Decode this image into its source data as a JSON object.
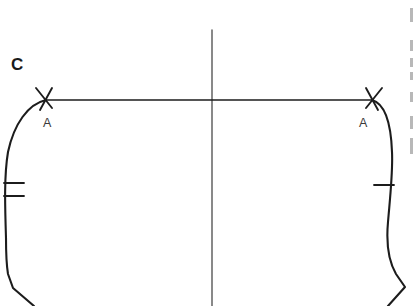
{
  "document": {
    "type": "scanned-pattern-diagram",
    "background_color": "#ffffff",
    "ink_color": "#1c1c1c",
    "width": 416,
    "height": 306
  },
  "labels": {
    "piece": "C",
    "notch_left": "A",
    "notch_right": "A"
  },
  "annotations": {
    "piece_label_note": "Pattern piece identifier",
    "notch_note": "Matching point marks"
  },
  "geometry": {
    "horizontal_rule": {
      "x1": 46,
      "y1": 100,
      "x2": 372,
      "y2": 100
    },
    "center_fold_line": {
      "x": 212,
      "y1": 30,
      "y2": 306
    },
    "left_edge_path": "M46,100 C28,104 14,124 8,152 C4,176 5,206 6,238 C6,256 7,268 8,274 L13,288 L34,306",
    "right_edge_path": "M372,100 C386,104 391,124 392,152 C393,172 390,198 388,222 C386,244 389,262 396,274 L405,287 L388,306",
    "left_notch_tick": {
      "x": 46,
      "y": 100,
      "arm1": "M36,88 L52,108",
      "arm2": "M52,88 L40,110"
    },
    "right_notch_tick": {
      "x": 372,
      "y": 100,
      "arm1": "M382,88 L366,108",
      "arm2": "M366,88 L378,110"
    },
    "left_balance_notches": [
      {
        "x1": 4,
        "y1": 183,
        "x2": 24,
        "y2": 183
      },
      {
        "x1": 4,
        "y1": 196,
        "x2": 24,
        "y2": 196
      }
    ],
    "right_balance_notches": [
      {
        "x1": 374,
        "y1": 185,
        "x2": 394,
        "y2": 185
      }
    ]
  },
  "label_positions": {
    "piece": {
      "left": 11,
      "top": 56
    },
    "notch_left": {
      "left": 43,
      "top": 117
    },
    "notch_right": {
      "left": 359,
      "top": 117
    }
  },
  "edge_fragments": [
    {
      "top": 8,
      "height": 14
    },
    {
      "top": 40,
      "height": 11
    },
    {
      "top": 58,
      "height": 9
    },
    {
      "top": 72,
      "height": 8
    },
    {
      "top": 92,
      "height": 10
    },
    {
      "top": 116,
      "height": 13
    },
    {
      "top": 138,
      "height": 16
    }
  ]
}
